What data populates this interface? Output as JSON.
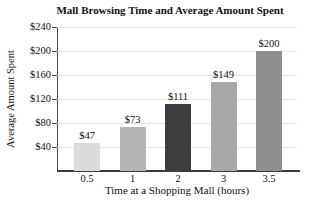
{
  "chart_data": {
    "type": "bar",
    "title": "Mall Browsing Time and Average Amount Spent",
    "xlabel": "Time at a Shopping Mall (hours)",
    "ylabel": "Average Amount Spent",
    "categories": [
      "0.5",
      "1",
      "2",
      "3",
      "3.5"
    ],
    "values": [
      47,
      73,
      111,
      149,
      200
    ],
    "value_labels": [
      "$47",
      "$73",
      "$111",
      "$149",
      "$200"
    ],
    "yticks": [
      "$40",
      "$80",
      "$120",
      "$160",
      "$200",
      "$240"
    ],
    "ytick_interval": 40,
    "ylim": [
      0,
      240
    ],
    "grid": "horizontal-light",
    "legend": "none",
    "bar_colors": [
      "#dcdcdc",
      "#b5b5b5",
      "#3e3e3e",
      "#a9a9a9",
      "#8f8f8f"
    ]
  },
  "colors": {
    "background": "#ffffff",
    "axis": "#474747",
    "baseline": "#3c3c3c",
    "grid": "#e4e4e4",
    "text": "#111111"
  }
}
